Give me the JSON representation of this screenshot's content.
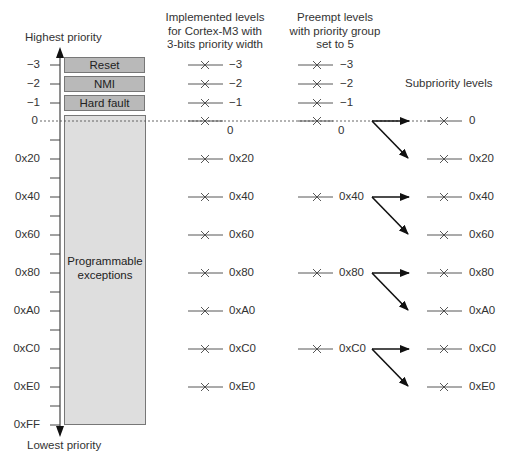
{
  "axis": {
    "top_label": "Highest priority",
    "bottom_label": "Lowest priority",
    "tick_labels": [
      "−3",
      "−2",
      "−1",
      "0",
      "0x20",
      "0x40",
      "0x60",
      "0x80",
      "0xA0",
      "0xC0",
      "0xE0",
      "0xFF"
    ]
  },
  "blocks": {
    "reset": "Reset",
    "nmi": "NMI",
    "hard_fault": "Hard fault",
    "programmable_line1": "Programmable",
    "programmable_line2": "exceptions"
  },
  "columns": {
    "implemented": {
      "header_line1": "Implemented levels",
      "header_line2": "for Cortex-M3 with",
      "header_line3": "3-bits priority width",
      "levels": [
        "−3",
        "−2",
        "−1",
        "0",
        "0x20",
        "0x40",
        "0x60",
        "0x80",
        "0xA0",
        "0xC0",
        "0xE0"
      ]
    },
    "preempt": {
      "header_line1": "Preempt levels",
      "header_line2": "with priority group",
      "header_line3": "set to 5",
      "levels": [
        "−3",
        "−2",
        "−1",
        "0",
        "0x40",
        "0x80",
        "0xC0"
      ]
    },
    "subpriority": {
      "header": "Subpriority levels",
      "levels": [
        "0",
        "0x20",
        "0x40",
        "0x60",
        "0x80",
        "0xA0",
        "0xC0",
        "0xE0"
      ]
    }
  },
  "colors": {
    "fixed_block": "#b9b9b9",
    "programmable_block": "#dedede",
    "line": "#333333"
  }
}
